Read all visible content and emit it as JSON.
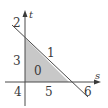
{
  "diagram": {
    "axes": {
      "horizontal_label": "s",
      "vertical_label": "t"
    },
    "regions": [
      {
        "id": "region-0",
        "label": "0",
        "x": 37,
        "y": 74
      },
      {
        "id": "region-1",
        "label": "1",
        "x": 50,
        "y": 56
      },
      {
        "id": "region-2",
        "label": "2",
        "x": 17,
        "y": 26
      },
      {
        "id": "region-3",
        "label": "3",
        "x": 17,
        "y": 64
      },
      {
        "id": "region-4",
        "label": "4",
        "x": 18,
        "y": 95
      },
      {
        "id": "region-5",
        "label": "5",
        "x": 49,
        "y": 95
      },
      {
        "id": "region-6",
        "label": "6",
        "x": 87,
        "y": 95
      }
    ],
    "colors": {
      "shade": "#c8c8c8",
      "line": "#4a4a4a"
    }
  }
}
